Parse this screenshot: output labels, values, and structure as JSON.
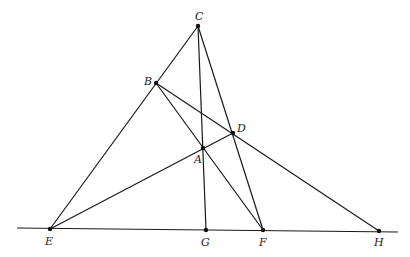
{
  "diagram": {
    "type": "projective-geometry-figure",
    "colors": {
      "ink": "#1a1a1a",
      "background": "#ffffff"
    },
    "baseline": {
      "x1": 17,
      "y1": 228,
      "x2": 398,
      "y2": 232
    },
    "points": [
      {
        "id": "C",
        "label": "C",
        "x": 198,
        "y": 26,
        "lx": 195,
        "ly": 20
      },
      {
        "id": "B",
        "label": "B",
        "x": 156,
        "y": 83,
        "lx": 144,
        "ly": 85
      },
      {
        "id": "D",
        "label": "D",
        "x": 233,
        "y": 133,
        "lx": 237,
        "ly": 132
      },
      {
        "id": "A",
        "label": "A",
        "x": 203,
        "y": 148,
        "lx": 194,
        "ly": 163
      },
      {
        "id": "E",
        "label": "E",
        "x": 50,
        "y": 229,
        "lx": 45,
        "ly": 245
      },
      {
        "id": "G",
        "label": "G",
        "x": 206,
        "y": 230,
        "lx": 201,
        "ly": 246
      },
      {
        "id": "F",
        "label": "F",
        "x": 263,
        "y": 230,
        "lx": 259,
        "ly": 246
      },
      {
        "id": "H",
        "label": "H",
        "x": 379,
        "y": 231,
        "lx": 374,
        "ly": 246
      }
    ],
    "segments": [
      [
        "E",
        "C"
      ],
      [
        "C",
        "G"
      ],
      [
        "C",
        "F"
      ],
      [
        "B",
        "F"
      ],
      [
        "B",
        "H"
      ],
      [
        "E",
        "D"
      ]
    ]
  }
}
